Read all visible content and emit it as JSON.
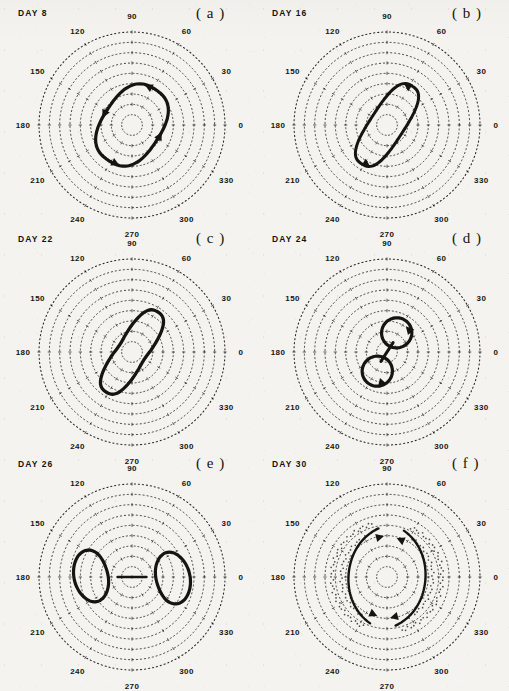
{
  "figure": {
    "caption": "",
    "background_color": "#f3f2ef",
    "ink_color": "#15140f"
  },
  "axis": {
    "angle_labels": [
      "0",
      "30",
      "60",
      "90",
      "120",
      "150",
      "180",
      "210",
      "240",
      "270",
      "300",
      "330"
    ],
    "angle_values": [
      0,
      30,
      60,
      90,
      120,
      150,
      180,
      210,
      240,
      270,
      300,
      330
    ],
    "ring_count": 9,
    "grid_style": "dotted"
  },
  "panels": [
    {
      "id": "a",
      "letter": "( a )",
      "title": "DAY 8",
      "day": 8,
      "shape": "closed oval ring, tilted along 60-240 axis, arrowheads indicating clockwise circulation"
    },
    {
      "id": "b",
      "letter": "( b )",
      "title": "DAY 16",
      "day": 16,
      "shape": "elongated ellipse tilted along 60-240 axis"
    },
    {
      "id": "c",
      "letter": "( c )",
      "title": "DAY 22",
      "day": 22,
      "shape": "peanut / dumbbell contour pinched at centre, tilted along 60-240 axis"
    },
    {
      "id": "d",
      "letter": "( d )",
      "title": "DAY 24",
      "day": 24,
      "shape": "figure-eight, two lobes joined at centre"
    },
    {
      "id": "e",
      "letter": "( e )",
      "title": "DAY 26",
      "day": 26,
      "shape": "two separate closed loops either side of centre"
    },
    {
      "id": "f",
      "letter": "( f )",
      "title": "DAY 30",
      "day": 30,
      "shape": "two detached spiral arcs with arrowheads, upper-left and lower-right"
    }
  ],
  "chart_data": {
    "type": "line",
    "plot_kind": "polar",
    "title": "",
    "xlabel": "",
    "ylabel": "",
    "grid": true,
    "legend_position": "none",
    "theta_unit": "degrees",
    "theta_ticks": [
      0,
      30,
      60,
      90,
      120,
      150,
      180,
      210,
      240,
      270,
      300,
      330
    ],
    "theta_tick_labels": [
      "0",
      "30",
      "60",
      "90",
      "120",
      "150",
      "180",
      "210",
      "240",
      "270",
      "300",
      "330"
    ],
    "r_rings": 9,
    "rlim": [
      0,
      1
    ],
    "panel_labels": [
      "( a )",
      "( b )",
      "( c )",
      "( d )",
      "( e )",
      "( f )"
    ],
    "panel_titles": [
      "DAY 8",
      "DAY 16",
      "DAY 22",
      "DAY 24",
      "DAY 26",
      "DAY 30"
    ],
    "series": [
      {
        "name": "DAY 8",
        "panel": "a",
        "closed": true,
        "r": [
          0.4,
          0.42,
          0.44,
          0.45,
          0.44,
          0.41,
          0.37,
          0.33,
          0.3,
          0.28,
          0.28,
          0.3,
          0.33,
          0.37,
          0.4,
          0.42,
          0.44,
          0.45,
          0.44,
          0.41,
          0.37,
          0.33,
          0.3,
          0.28,
          0.28,
          0.3,
          0.33,
          0.37,
          0.4
        ],
        "theta": [
          60,
          75,
          90,
          105,
          120,
          135,
          150,
          165,
          180,
          195,
          210,
          225,
          240,
          255,
          270,
          285,
          300,
          315,
          330,
          345,
          0,
          15,
          30,
          45,
          60,
          75,
          90,
          105,
          120
        ]
      },
      {
        "name": "DAY 16",
        "panel": "b",
        "closed": true,
        "r": [
          0.46,
          0.47,
          0.45,
          0.4,
          0.33,
          0.26,
          0.2,
          0.17,
          0.17,
          0.2,
          0.26,
          0.33,
          0.4,
          0.45,
          0.47,
          0.46,
          0.42,
          0.36,
          0.29,
          0.23,
          0.18,
          0.16,
          0.17,
          0.21,
          0.27,
          0.34,
          0.41,
          0.46,
          0.46
        ],
        "theta": [
          60,
          70,
          80,
          90,
          100,
          110,
          120,
          130,
          140,
          150,
          160,
          170,
          180,
          190,
          200,
          210,
          220,
          230,
          240,
          250,
          260,
          270,
          280,
          290,
          300,
          310,
          320,
          330,
          340
        ]
      },
      {
        "name": "DAY 22",
        "panel": "c",
        "closed": true,
        "r": [
          0.5,
          0.49,
          0.44,
          0.36,
          0.26,
          0.17,
          0.11,
          0.09,
          0.11,
          0.17,
          0.26,
          0.36,
          0.44,
          0.49,
          0.5,
          0.49,
          0.44,
          0.36,
          0.26,
          0.17,
          0.11,
          0.09,
          0.11,
          0.17,
          0.26,
          0.36,
          0.44,
          0.49,
          0.5
        ],
        "theta": [
          60,
          70,
          80,
          90,
          100,
          110,
          120,
          130,
          140,
          150,
          160,
          170,
          180,
          190,
          200,
          210,
          220,
          230,
          240,
          250,
          260,
          270,
          280,
          290,
          300,
          310,
          320,
          330,
          340
        ]
      },
      {
        "name": "DAY 24",
        "panel": "d",
        "closed": true,
        "lobes": 2,
        "r": [
          0.34,
          0.33,
          0.29,
          0.22,
          0.13,
          0.05,
          0.04,
          0.12,
          0.21,
          0.29,
          0.33,
          0.34,
          0.33,
          0.29,
          0.22,
          0.13,
          0.05,
          0.04,
          0.12,
          0.21,
          0.29,
          0.33,
          0.34
        ],
        "theta": [
          20,
          40,
          60,
          80,
          100,
          115,
          125,
          145,
          165,
          185,
          200,
          200,
          220,
          240,
          260,
          280,
          295,
          305,
          325,
          345,
          5,
          20,
          20
        ]
      },
      {
        "name": "DAY 26",
        "panel": "e",
        "closed": true,
        "lobes": 2,
        "lobe_centers_theta": [
          180,
          0
        ],
        "lobe_center_r": 0.26,
        "lobe_radius": 0.15
      },
      {
        "name": "DAY 30",
        "panel": "f",
        "closed": false,
        "arcs": 2,
        "arc_center_r": 0.34,
        "arc_span_deg": 150,
        "arc_start_theta": [
          100,
          280
        ],
        "arrowheads": true
      }
    ]
  }
}
